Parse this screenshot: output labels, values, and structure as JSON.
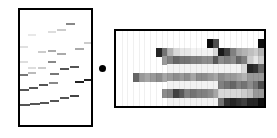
{
  "figure": {
    "left_panel": {
      "label": "band-trace-panel",
      "bands": [
        {
          "x": 0,
          "y": 81,
          "w": 10,
          "shade": "#555555"
        },
        {
          "x": 10,
          "y": 80,
          "w": 10,
          "shade": "#555555"
        },
        {
          "x": 20,
          "y": 79,
          "w": 9,
          "shade": "#555555"
        },
        {
          "x": 30,
          "y": 77,
          "w": 9,
          "shade": "#555555"
        },
        {
          "x": 40,
          "y": 74,
          "w": 9,
          "shade": "#555555"
        },
        {
          "x": 50,
          "y": 72,
          "w": 9,
          "shade": "#444444"
        },
        {
          "x": 0,
          "y": 66,
          "w": 9,
          "shade": "#555555"
        },
        {
          "x": 9,
          "y": 64,
          "w": 9,
          "shade": "#555555"
        },
        {
          "x": 19,
          "y": 61,
          "w": 9,
          "shade": "#555555"
        },
        {
          "x": 29,
          "y": 59,
          "w": 9,
          "shade": "#888888"
        },
        {
          "x": 55,
          "y": 58,
          "w": 9,
          "shade": "#222222"
        },
        {
          "x": 64,
          "y": 56,
          "w": 9,
          "shade": "#222222"
        },
        {
          "x": 0,
          "y": 51,
          "w": 8,
          "shade": "#777777"
        },
        {
          "x": 8,
          "y": 49,
          "w": 8,
          "shade": "#bbbbbb"
        },
        {
          "x": 30,
          "y": 50,
          "w": 9,
          "shade": "#777777"
        },
        {
          "x": 40,
          "y": 45,
          "w": 9,
          "shade": "#555555"
        },
        {
          "x": 50,
          "y": 43,
          "w": 9,
          "shade": "#555555"
        },
        {
          "x": 0,
          "y": 38,
          "w": 8,
          "shade": "#dddddd"
        },
        {
          "x": 28,
          "y": 38,
          "w": 8,
          "shade": "#888888"
        },
        {
          "x": 8,
          "y": 44,
          "w": 8,
          "shade": "#dddddd"
        },
        {
          "x": 18,
          "y": 44,
          "w": 8,
          "shade": "#cccccc"
        },
        {
          "x": 0,
          "y": 23,
          "w": 8,
          "shade": "#e0e0e0"
        },
        {
          "x": 18,
          "y": 28,
          "w": 8,
          "shade": "#cccccc"
        },
        {
          "x": 28,
          "y": 27,
          "w": 8,
          "shade": "#aaaaaa"
        },
        {
          "x": 37,
          "y": 30,
          "w": 9,
          "shade": "#aaaaaa"
        },
        {
          "x": 55,
          "y": 25,
          "w": 9,
          "shade": "#aaaaaa"
        },
        {
          "x": 64,
          "y": 19,
          "w": 8,
          "shade": "#cccccc"
        },
        {
          "x": 8,
          "y": 11,
          "w": 8,
          "shade": "#e8e8e8"
        },
        {
          "x": 28,
          "y": 8,
          "w": 8,
          "shade": "#dddddd"
        },
        {
          "x": 37,
          "y": 6,
          "w": 9,
          "shade": "#cccccc"
        },
        {
          "x": 46,
          "y": 0,
          "w": 9,
          "shade": "#888888"
        }
      ]
    },
    "separator": {
      "label": "dot"
    },
    "right_panel": {
      "label": "heatmap-panel",
      "rows": 8,
      "cols": 26,
      "grid": [
        [
          0,
          0,
          0,
          0,
          0,
          0,
          0,
          0,
          0,
          0,
          0,
          0,
          0,
          0,
          0,
          0,
          0,
          0,
          0,
          0,
          0,
          0,
          0,
          0,
          0,
          0
        ],
        [
          0,
          0,
          0,
          0,
          0,
          0,
          0,
          0,
          0,
          0,
          0,
          0,
          0,
          0,
          0,
          0,
          95,
          70,
          0,
          0,
          0,
          0,
          0,
          0,
          0,
          95
        ],
        [
          0,
          0,
          0,
          0,
          0,
          0,
          0,
          85,
          55,
          30,
          15,
          10,
          10,
          5,
          5,
          5,
          5,
          15,
          90,
          75,
          50,
          35,
          30,
          25,
          20,
          30
        ],
        [
          0,
          0,
          0,
          0,
          0,
          0,
          0,
          0,
          40,
          50,
          60,
          55,
          55,
          50,
          50,
          45,
          45,
          65,
          45,
          50,
          45,
          60,
          50,
          20,
          10,
          20
        ],
        [
          0,
          0,
          0,
          0,
          0,
          0,
          0,
          0,
          0,
          5,
          5,
          5,
          5,
          5,
          5,
          5,
          5,
          5,
          5,
          5,
          5,
          5,
          15,
          85,
          80,
          60
        ],
        [
          0,
          0,
          0,
          60,
          40,
          35,
          40,
          45,
          35,
          40,
          45,
          40,
          45,
          35,
          45,
          45,
          40,
          35,
          45,
          40,
          40,
          35,
          30,
          40,
          40,
          40
        ],
        [
          0,
          0,
          0,
          0,
          0,
          0,
          0,
          0,
          0,
          5,
          5,
          5,
          5,
          5,
          5,
          5,
          5,
          5,
          50,
          55,
          60,
          50,
          55,
          45,
          55,
          70
        ],
        [
          0,
          0,
          0,
          0,
          0,
          0,
          0,
          0,
          45,
          50,
          75,
          65,
          50,
          55,
          50,
          50,
          45,
          35,
          15,
          15,
          15,
          15,
          20,
          25,
          40,
          40
        ],
        [
          0,
          0,
          0,
          0,
          0,
          0,
          0,
          0,
          0,
          5,
          5,
          5,
          5,
          5,
          5,
          5,
          5,
          5,
          55,
          80,
          85,
          80,
          75,
          85,
          85,
          95
        ]
      ],
      "vlines": [
        5,
        6,
        8,
        11,
        12,
        18,
        17
      ]
    }
  }
}
